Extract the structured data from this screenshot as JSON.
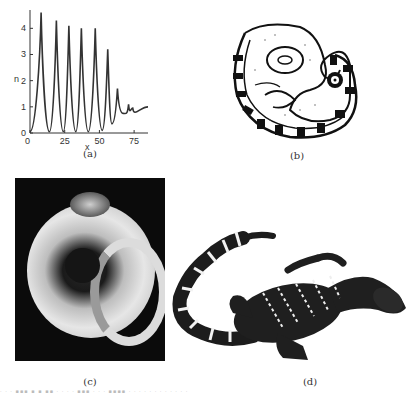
{
  "figure": {
    "panels": [
      {
        "id": "a",
        "label": "(a)",
        "kind": "plot"
      },
      {
        "id": "b",
        "label": "(b)",
        "kind": "line-drawing",
        "subject": "coiled embryo-like figure with banded tail"
      },
      {
        "id": "c",
        "label": "(c)",
        "kind": "photograph",
        "subject": "curled embryo on black background"
      },
      {
        "id": "d",
        "label": "(d)",
        "kind": "illustration",
        "subject": "banded lizard / alligator with striped tail"
      }
    ]
  },
  "chart_data": {
    "type": "line",
    "title": "",
    "xlabel": "x",
    "ylabel": "n",
    "xlim": [
      0,
      85
    ],
    "ylim": [
      0,
      4.7
    ],
    "x_ticks": [
      0,
      25,
      50,
      75
    ],
    "y_ticks": [
      0,
      1,
      2,
      3,
      4
    ],
    "grid": false,
    "legend": null,
    "series": [
      {
        "name": "n(x)",
        "peaks": [
          {
            "x": 8,
            "y": 4.6
          },
          {
            "x": 19,
            "y": 4.3
          },
          {
            "x": 28,
            "y": 4.1
          },
          {
            "x": 37,
            "y": 4.0
          },
          {
            "x": 47,
            "y": 4.0
          },
          {
            "x": 56,
            "y": 3.2
          },
          {
            "x": 63,
            "y": 1.7
          },
          {
            "x": 71,
            "y": 1.1
          }
        ],
        "troughs": [
          {
            "x": 0,
            "y": 0.05
          },
          {
            "x": 14,
            "y": 0.05
          },
          {
            "x": 24,
            "y": 0.05
          },
          {
            "x": 33,
            "y": 0.05
          },
          {
            "x": 42,
            "y": 0.05
          },
          {
            "x": 52,
            "y": 0.1
          },
          {
            "x": 59,
            "y": 0.35
          },
          {
            "x": 67,
            "y": 0.75
          },
          {
            "x": 74,
            "y": 0.95
          }
        ],
        "steady_state": {
          "x_from": 75,
          "x_to": 85,
          "y": 1.0
        }
      }
    ]
  },
  "captions": {
    "a": "(a)",
    "b": "(b)",
    "c": "(c)",
    "d": "(d)"
  },
  "axis_labels": {
    "x": "x",
    "y": "n",
    "x_ticks": [
      "0",
      "25",
      "50",
      "75"
    ],
    "y_ticks": [
      "0",
      "1",
      "2",
      "3",
      "4"
    ]
  }
}
